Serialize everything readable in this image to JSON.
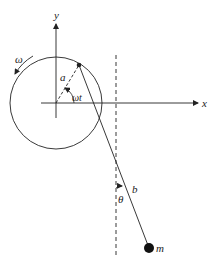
{
  "diagram": {
    "labels": {
      "y_axis": "y",
      "x_axis": "x",
      "angular_velocity": "ω",
      "radius": "a",
      "rotation_angle": "ωt",
      "pendulum_length": "b",
      "pendulum_angle": "θ",
      "mass": "m"
    },
    "colors": {
      "stroke": "#222222",
      "background": "#ffffff"
    }
  }
}
